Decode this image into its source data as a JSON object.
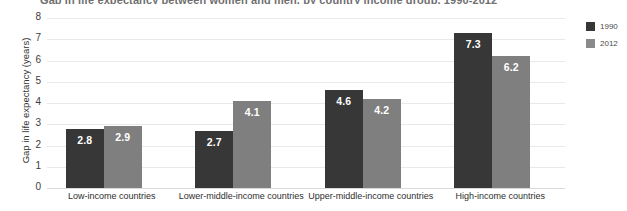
{
  "chart_data": {
    "type": "bar",
    "title": "Gap in life expectancy between women and men, by country income group, 1990-2012",
    "xlabel": "",
    "ylabel": "Gap in life expectancy (years)",
    "ylim": [
      0,
      8
    ],
    "yticks": [
      8,
      7,
      6,
      5,
      4,
      3,
      2,
      1,
      0
    ],
    "grid": true,
    "legend_position": "right",
    "categories": [
      "Low-income countries",
      "Lower-middle-income countries",
      "Upper-middle-income countries",
      "High-income countries"
    ],
    "series": [
      {
        "name": "1990",
        "color": "#373737",
        "values": [
          2.8,
          2.7,
          4.6,
          7.3
        ],
        "labels": [
          "2.8",
          "2.7",
          "4.6",
          "7.3"
        ]
      },
      {
        "name": "2012",
        "color": "#7f7f7f",
        "values": [
          2.9,
          4.1,
          4.2,
          6.2
        ],
        "labels": [
          "2.9",
          "4.1",
          "4.2",
          "6.2"
        ]
      }
    ]
  },
  "legend": {
    "items": [
      {
        "label": "1990"
      },
      {
        "label": "2012"
      }
    ]
  },
  "colors": {
    "series_1990": "#373737",
    "series_2012": "#7f7f7f",
    "gridline": "#e9e9e9",
    "text": "#2b2b2b"
  }
}
